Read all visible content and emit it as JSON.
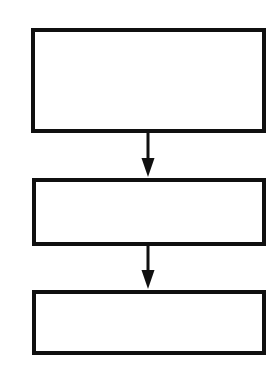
{
  "document": {
    "kind": "flowchart",
    "title": "",
    "background_color": "#ffffff",
    "stroke_color": "#101010",
    "canvas": {
      "width": 280,
      "height": 369
    }
  },
  "nodes": [
    {
      "id": "node-1",
      "shape": "rectangle",
      "label": "",
      "x": 31,
      "y": 28,
      "width": 235,
      "height": 105,
      "border_width": 4,
      "fill": "#ffffff",
      "stroke": "#101010"
    },
    {
      "id": "node-2",
      "shape": "rectangle",
      "label": "",
      "x": 32,
      "y": 178,
      "width": 234,
      "height": 68,
      "border_width": 4,
      "fill": "#ffffff",
      "stroke": "#101010"
    },
    {
      "id": "node-3",
      "shape": "rectangle",
      "label": "",
      "x": 32,
      "y": 290,
      "width": 234,
      "height": 65,
      "border_width": 4,
      "fill": "#ffffff",
      "stroke": "#101010"
    }
  ],
  "connectors": [
    {
      "id": "connector-1",
      "from": "node-1",
      "to": "node-2",
      "label": "",
      "direction": "down",
      "x": 148,
      "y_start": 132,
      "y_end": 177,
      "stem_width": 3,
      "head_width": 13,
      "head_height": 19,
      "stroke": "#101010"
    },
    {
      "id": "connector-2",
      "from": "node-2",
      "to": "node-3",
      "label": "",
      "direction": "down",
      "x": 148,
      "y_start": 245,
      "y_end": 289,
      "stem_width": 3,
      "head_width": 13,
      "head_height": 19,
      "stroke": "#101010"
    }
  ]
}
